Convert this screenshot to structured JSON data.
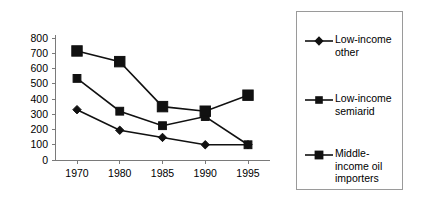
{
  "chart_data": {
    "type": "line",
    "title": "",
    "subtitle": "",
    "xlabel": "",
    "ylabel": "",
    "categories": [
      "1970",
      "1980",
      "1985",
      "1990",
      "1995"
    ],
    "ylim": [
      0,
      800
    ],
    "ytick_labels": [
      "0",
      "100",
      "200",
      "300",
      "400",
      "500",
      "600",
      "700",
      "800"
    ],
    "ytick_values": [
      0,
      100,
      200,
      300,
      400,
      500,
      600,
      700,
      800
    ],
    "grid": false,
    "legend_position": "right",
    "series": [
      {
        "name": "Low-income other",
        "legend_label": "Low-income\nother",
        "marker": "diamond",
        "marker_size": "small",
        "color": "#111111",
        "values": [
          330,
          195,
          148,
          100,
          100
        ]
      },
      {
        "name": "Low-income semiarid",
        "legend_label": "Low-income\nsemiarid",
        "marker": "square",
        "marker_size": "small",
        "color": "#111111",
        "values": [
          535,
          320,
          225,
          285,
          100
        ]
      },
      {
        "name": "Middle-income oil importers",
        "legend_label": "Middle-\nincome oil\nimporters",
        "marker": "square",
        "marker_size": "large",
        "color": "#111111",
        "values": [
          715,
          645,
          350,
          320,
          425
        ]
      }
    ]
  },
  "icons": {
    "diamond_marker": "diamond-marker-icon",
    "square_marker": "square-marker-icon"
  }
}
